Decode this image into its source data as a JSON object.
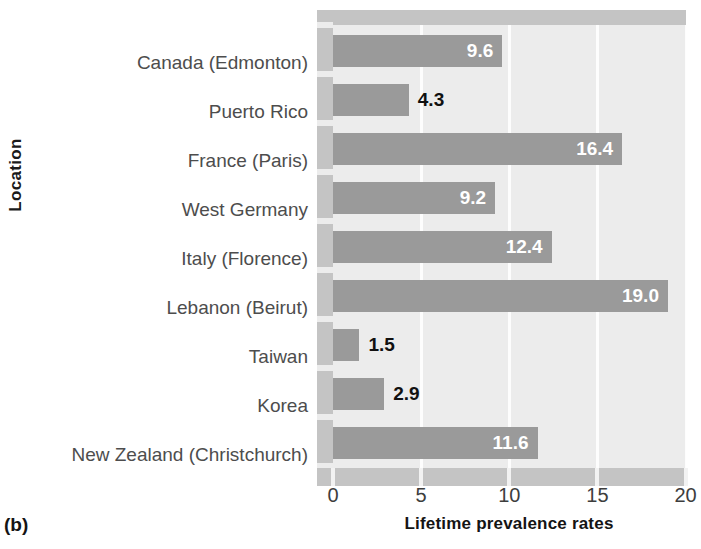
{
  "panel_label": "(b)",
  "axis": {
    "y_title": "Location",
    "x_title": "Lifetime prevalence rates",
    "x_ticks": [
      "0",
      "5",
      "10",
      "15",
      "20"
    ]
  },
  "colors": {
    "bar": "#9a9a9a",
    "plot_background": "#ececec",
    "frame": "#c4c4c4",
    "gridline": "#fdfdfd",
    "label_inside": "#ffffff",
    "label_outside": "#111111"
  },
  "chart_data": {
    "type": "bar",
    "orientation": "horizontal",
    "title": "",
    "subtitle": "",
    "xlabel": "Lifetime prevalence rates",
    "ylabel": "Location",
    "xlim": [
      0,
      20
    ],
    "xticks": [
      0,
      5,
      10,
      15,
      20
    ],
    "grid": "vertical-white-gridlines",
    "legend": "none",
    "categories": [
      "Canada (Edmonton)",
      "Puerto Rico",
      "France (Paris)",
      "West Germany",
      "Italy (Florence)",
      "Lebanon (Beirut)",
      "Taiwan",
      "Korea",
      "New Zealand (Christchurch)"
    ],
    "values": [
      9.6,
      4.3,
      16.4,
      9.2,
      12.4,
      19.0,
      1.5,
      2.9,
      11.6
    ],
    "value_labels": [
      "9.6",
      "4.3",
      "16.4",
      "9.2",
      "12.4",
      "19.0",
      "1.5",
      "2.9",
      "11.6"
    ],
    "label_placement": [
      "inside",
      "outside",
      "inside",
      "inside",
      "inside",
      "inside",
      "outside",
      "outside",
      "inside"
    ]
  }
}
